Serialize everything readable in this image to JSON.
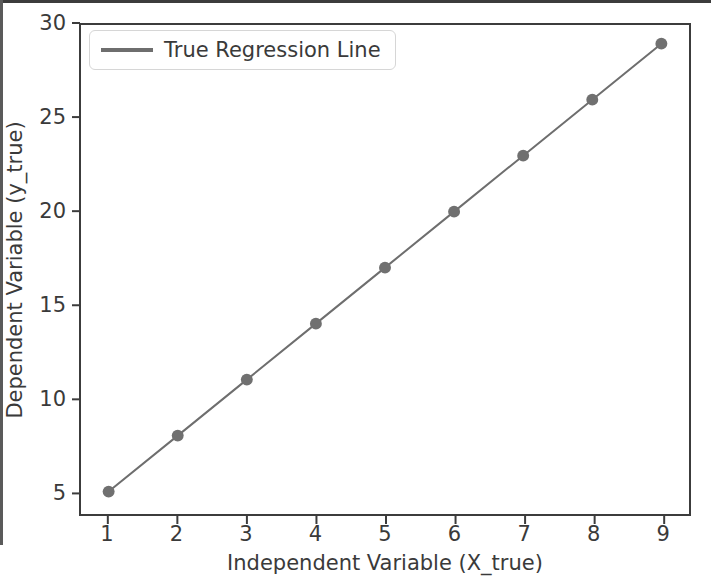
{
  "chart_data": {
    "type": "line",
    "title": "",
    "xlabel": "Independent Variable (X_true)",
    "ylabel": "Dependent Variable (y_true)",
    "x": [
      1,
      2,
      3,
      4,
      5,
      6,
      7,
      8,
      9
    ],
    "series": [
      {
        "name": "True Regression Line",
        "values": [
          5,
          8,
          11,
          14,
          17,
          20,
          23,
          26,
          29
        ],
        "color": "#6e6e6e",
        "marker": "circle",
        "linewidth": 2
      }
    ],
    "xlim": [
      0.6,
      9.4
    ],
    "ylim": [
      3.8,
      30.0
    ],
    "xticks": [
      1,
      2,
      3,
      4,
      5,
      6,
      7,
      8,
      9
    ],
    "xtick_labels": [
      "1",
      "2",
      "3",
      "4",
      "5",
      "6",
      "7",
      "8",
      "9"
    ],
    "yticks": [
      5,
      10,
      15,
      20,
      25,
      30
    ],
    "ytick_labels": [
      "5",
      "10",
      "15",
      "20",
      "25",
      "30"
    ],
    "grid": false,
    "legend": {
      "position": "upper-left",
      "entries": [
        "True Regression Line"
      ]
    },
    "colors": {
      "line": "#6e6e6e",
      "marker": "#707070",
      "text": "#3a3a3a",
      "axes_border": "#3c3c3c",
      "background": "#ffffff",
      "legend_border": "#d6d6d6"
    }
  }
}
